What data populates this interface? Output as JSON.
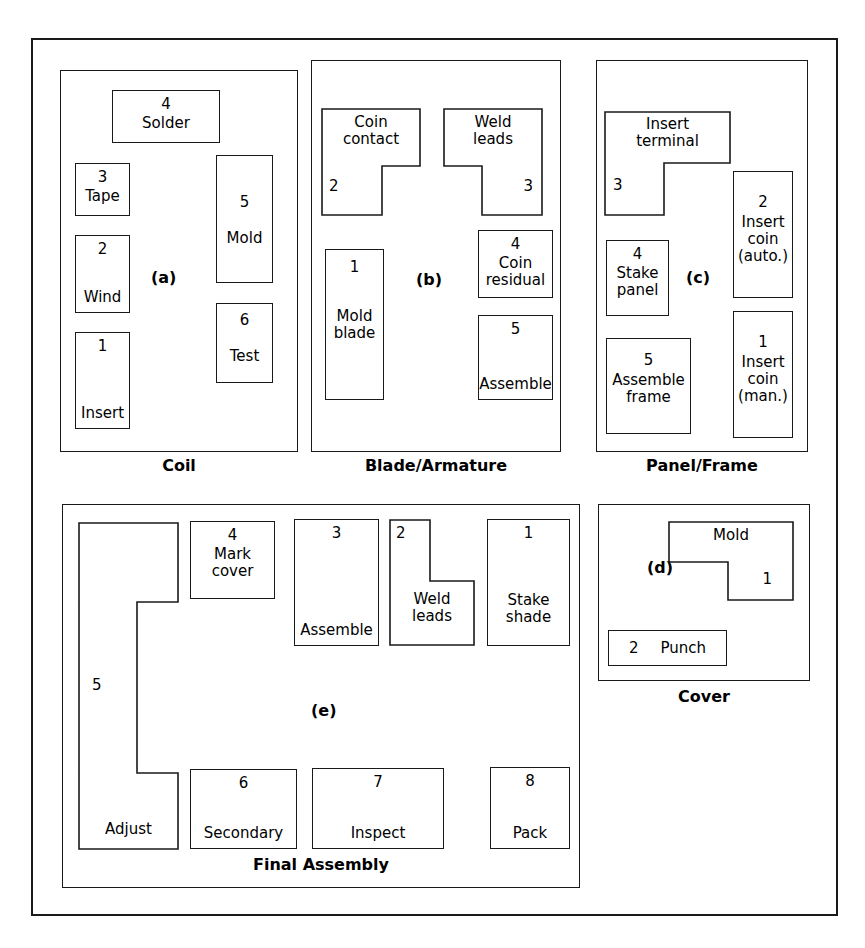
{
  "figure": {
    "background_color": "#ffffff",
    "line_color": "#1a1a1a"
  },
  "departments": [
    {
      "id": "a",
      "letter": "(a)",
      "caption": "Coil",
      "stations": [
        {
          "num": "4",
          "name": "Solder",
          "shape": "rect"
        },
        {
          "num": "3",
          "name": "Tape",
          "shape": "rect"
        },
        {
          "num": "2",
          "name": "Wind",
          "shape": "rect"
        },
        {
          "num": "1",
          "name": "Insert",
          "shape": "rect"
        },
        {
          "num": "5",
          "name": "Mold",
          "shape": "rect"
        },
        {
          "num": "6",
          "name": "Test",
          "shape": "rect"
        }
      ]
    },
    {
      "id": "b",
      "letter": "(b)",
      "caption": "Blade/Armature",
      "stations": [
        {
          "num": "2",
          "name": "Coin\ncontact",
          "shape": "L-notch-bottom-right"
        },
        {
          "num": "3",
          "name": "Weld\nleads",
          "shape": "L-notch-bottom-left"
        },
        {
          "num": "1",
          "name": "Mold\nblade",
          "shape": "rect"
        },
        {
          "num": "4",
          "name": "Coin\nresidual",
          "shape": "rect"
        },
        {
          "num": "5",
          "name": "Assemble",
          "shape": "rect"
        }
      ]
    },
    {
      "id": "c",
      "letter": "(c)",
      "caption": "Panel/Frame",
      "stations": [
        {
          "num": "3",
          "name": "Insert\nterminal",
          "shape": "L-notch-bottom-right"
        },
        {
          "num": "4",
          "name": "Stake\npanel",
          "shape": "rect"
        },
        {
          "num": "5",
          "name": "Assemble\nframe",
          "shape": "rect"
        },
        {
          "num": "2",
          "name": "Insert\ncoin\n(auto.)",
          "shape": "rect"
        },
        {
          "num": "1",
          "name": "Insert\ncoin\n(man.)",
          "shape": "rect"
        }
      ]
    },
    {
      "id": "d",
      "letter": "(d)",
      "caption": "Cover",
      "stations": [
        {
          "num": "1",
          "name": "Mold",
          "shape": "L-notch-bottom-left"
        },
        {
          "num": "2",
          "name": "Punch",
          "shape": "rect"
        }
      ]
    },
    {
      "id": "e",
      "letter": "(e)",
      "caption": "Final Assembly",
      "stations": [
        {
          "num": "5",
          "name": "Adjust",
          "shape": "C-notch-right"
        },
        {
          "num": "4",
          "name": "Mark\ncover",
          "shape": "rect"
        },
        {
          "num": "3",
          "name": "Assemble",
          "shape": "rect"
        },
        {
          "num": "2",
          "name": "Weld\nleads",
          "shape": "L-notch-top-right"
        },
        {
          "num": "1",
          "name": "Stake\nshade",
          "shape": "rect"
        },
        {
          "num": "6",
          "name": "Secondary",
          "shape": "rect"
        },
        {
          "num": "7",
          "name": "Inspect",
          "shape": "rect"
        },
        {
          "num": "8",
          "name": "Pack",
          "shape": "rect"
        }
      ]
    }
  ]
}
